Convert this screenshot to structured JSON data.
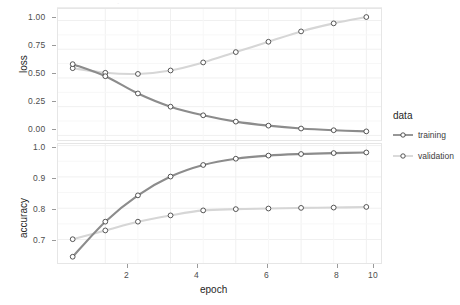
{
  "chart_data": [
    {
      "type": "line",
      "panel": "loss",
      "title": "",
      "xlabel": "epoch",
      "ylabel": "loss",
      "x": [
        1,
        2,
        3,
        4,
        5,
        6,
        7,
        8,
        9,
        10
      ],
      "xlim": [
        0.55,
        10.45
      ],
      "ylim": [
        -0.04,
        1.1
      ],
      "xticks": [
        2,
        4,
        6,
        8,
        10
      ],
      "xticklabels": [
        "2",
        "4",
        "6",
        "8",
        "10"
      ],
      "yticks": [
        0.0,
        0.25,
        0.5,
        0.75,
        1.0
      ],
      "yticklabels": [
        "0.00",
        "0.25",
        "0.50",
        "0.75",
        "1.00"
      ],
      "grid": true,
      "legend": "right",
      "series": [
        {
          "name": "training",
          "color": "#8c8c8c",
          "values": [
            0.62,
            0.515,
            0.365,
            0.25,
            0.175,
            0.12,
            0.085,
            0.06,
            0.045,
            0.035
          ]
        },
        {
          "name": "validation",
          "color": "#d6d6d6",
          "values": [
            0.585,
            0.545,
            0.535,
            0.565,
            0.635,
            0.725,
            0.815,
            0.905,
            0.975,
            1.03
          ]
        }
      ]
    },
    {
      "type": "line",
      "panel": "accuracy",
      "title": "",
      "xlabel": "epoch",
      "ylabel": "accuracy",
      "x": [
        1,
        2,
        3,
        4,
        5,
        6,
        7,
        8,
        9,
        10
      ],
      "xlim": [
        0.55,
        10.45
      ],
      "ylim": [
        0.625,
        1.005
      ],
      "xticks": [
        2,
        4,
        6,
        8,
        10
      ],
      "xticklabels": [
        "2",
        "4",
        "6",
        "8",
        "10"
      ],
      "yticks": [
        0.7,
        0.8,
        0.9,
        1.0
      ],
      "yticklabels": [
        "0.7",
        "0.8",
        "0.9",
        "1.0"
      ],
      "grid": true,
      "legend": "right",
      "series": [
        {
          "name": "training",
          "color": "#8c8c8c",
          "values": [
            0.645,
            0.757,
            0.841,
            0.901,
            0.938,
            0.958,
            0.968,
            0.973,
            0.976,
            0.978
          ]
        },
        {
          "name": "validation",
          "color": "#d6d6d6",
          "values": [
            0.701,
            0.729,
            0.757,
            0.777,
            0.793,
            0.797,
            0.799,
            0.801,
            0.802,
            0.804
          ]
        }
      ]
    }
  ],
  "axes": {
    "loss": {
      "y_title": "loss",
      "yticklabels": [
        "1.00",
        "0.75",
        "0.50",
        "0.25",
        "0.00"
      ]
    },
    "accuracy": {
      "y_title": "accuracy",
      "yticklabels": [
        "1.0",
        "0.9",
        "0.8",
        "0.7"
      ]
    },
    "x_title": "epoch",
    "xticklabels": [
      "2",
      "4",
      "6",
      "8",
      "10"
    ]
  },
  "legend": {
    "title": "data",
    "items": [
      {
        "label": "training",
        "color": "#8c8c8c"
      },
      {
        "label": "validation",
        "color": "#d6d6d6"
      }
    ]
  }
}
